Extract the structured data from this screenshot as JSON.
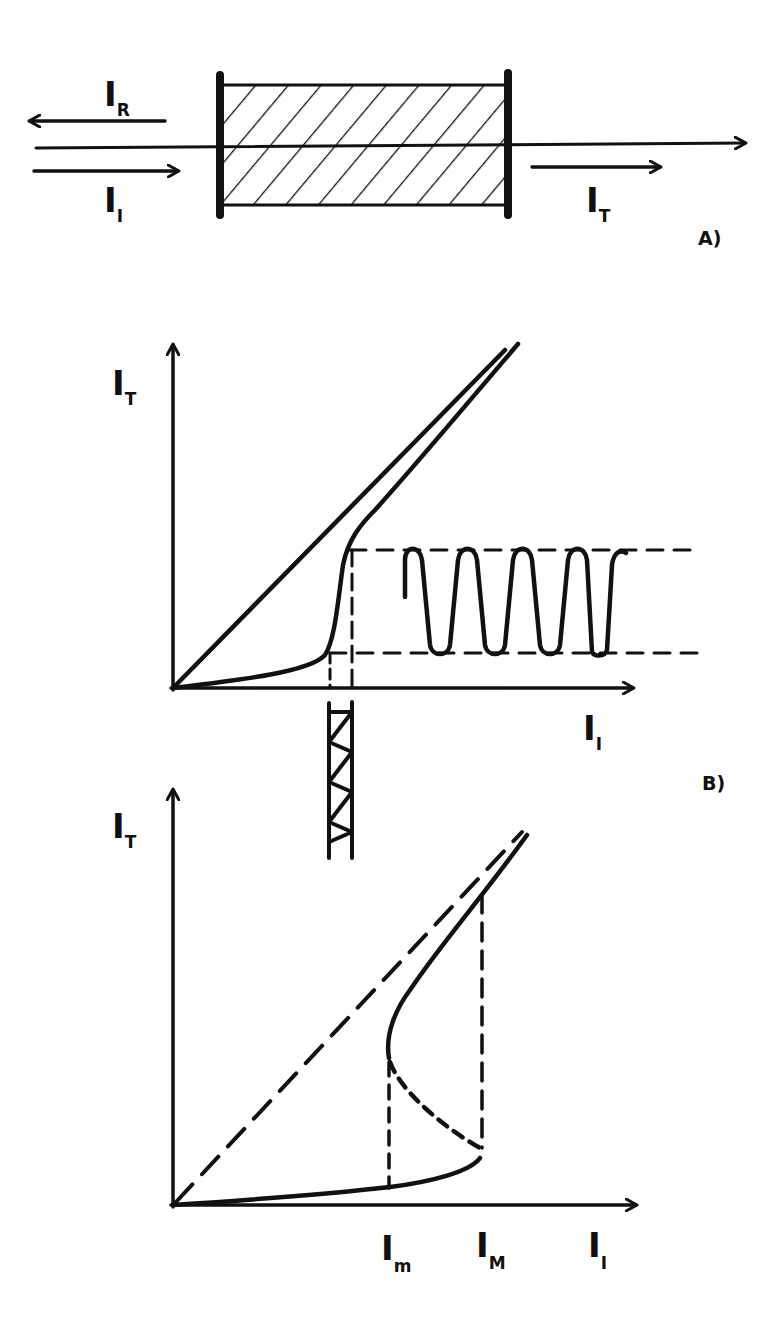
{
  "figure": {
    "background": "#ffffff",
    "ink_color": "#111111"
  },
  "panel_a": {
    "tag": "A)",
    "labels": {
      "reflected": {
        "main": "I",
        "sub": "R"
      },
      "incident": {
        "main": "I",
        "sub": "I"
      },
      "transmitted": {
        "main": "I",
        "sub": "T"
      }
    },
    "elements": [
      "nonlinear medium (hatched box between two mirrors)",
      "incident beam arrow",
      "reflected beam arrow",
      "transmitted beam arrow",
      "optical axis"
    ]
  },
  "panel_b": {
    "tag": "B)",
    "y_axis": {
      "main": "I",
      "sub": "T"
    },
    "x_axis": {
      "main": "I",
      "sub": "I"
    },
    "curves": [
      "linear transmission line (I_T = I_I)",
      "sigmoidal transmission curve with sharp threshold",
      "output modulation (square-like oscillation) between dashed levels",
      "input modulation (small zigzag) below x-axis"
    ]
  },
  "panel_c": {
    "y_axis": {
      "main": "I",
      "sub": "T"
    },
    "x_axis": {
      "main": "I",
      "sub": "I"
    },
    "thresholds": [
      {
        "main": "I",
        "sub": "m"
      },
      {
        "main": "I",
        "sub": "M"
      }
    ],
    "curves": [
      "dashed linear line (I_T = I_I)",
      "lower stable branch",
      "unstable middle branch (dashed)",
      "upper stable branch",
      "vertical dashed switching lines at I_m and I_M"
    ]
  }
}
